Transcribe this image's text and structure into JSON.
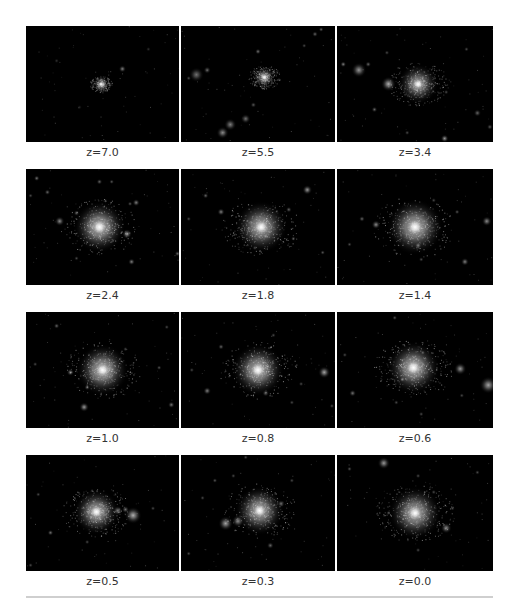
{
  "figure": {
    "rows": [
      {
        "panels": [
          {
            "caption": "z=7.0",
            "main": {
              "x": 0.49,
              "y": 0.5,
              "r": 0.05,
              "b": 0.55
            },
            "blobs": [
              [
                0.63,
                0.37,
                0.015,
                0.5
              ],
              [
                0.2,
                0.3,
                0.01,
                0.2
              ],
              [
                0.35,
                0.7,
                0.01,
                0.15
              ],
              [
                0.8,
                0.2,
                0.008,
                0.2
              ]
            ]
          },
          {
            "caption": "z=5.5",
            "main": {
              "x": 0.54,
              "y": 0.44,
              "r": 0.07,
              "b": 0.65
            },
            "blobs": [
              [
                0.1,
                0.42,
                0.03,
                0.45
              ],
              [
                0.17,
                0.38,
                0.015,
                0.4
              ],
              [
                0.05,
                0.45,
                0.01,
                0.3
              ],
              [
                0.32,
                0.85,
                0.025,
                0.5
              ],
              [
                0.27,
                0.92,
                0.025,
                0.55
              ],
              [
                0.42,
                0.8,
                0.02,
                0.45
              ],
              [
                0.47,
                0.68,
                0.012,
                0.35
              ],
              [
                0.5,
                0.22,
                0.012,
                0.45
              ],
              [
                0.87,
                0.07,
                0.012,
                0.4
              ],
              [
                0.91,
                0.03,
                0.01,
                0.4
              ],
              [
                0.8,
                0.17,
                0.008,
                0.3
              ]
            ]
          },
          {
            "caption": "z=3.4",
            "main": {
              "x": 0.52,
              "y": 0.5,
              "r": 0.13,
              "b": 0.75
            },
            "blobs": [
              [
                0.33,
                0.5,
                0.03,
                0.7
              ],
              [
                0.14,
                0.38,
                0.03,
                0.6
              ],
              [
                0.2,
                0.33,
                0.012,
                0.4
              ],
              [
                0.04,
                0.33,
                0.012,
                0.5
              ],
              [
                0.24,
                0.72,
                0.012,
                0.4
              ],
              [
                0.7,
                0.57,
                0.01,
                0.3
              ],
              [
                0.9,
                0.75,
                0.015,
                0.4
              ],
              [
                0.98,
                0.87,
                0.012,
                0.35
              ],
              [
                0.69,
                0.97,
                0.016,
                0.6
              ],
              [
                0.45,
                0.92,
                0.01,
                0.3
              ],
              [
                0.83,
                0.2,
                0.01,
                0.3
              ],
              [
                0.32,
                0.23,
                0.01,
                0.3
              ]
            ]
          }
        ]
      },
      {
        "panels": [
          {
            "caption": "z=2.4",
            "main": {
              "x": 0.48,
              "y": 0.5,
              "r": 0.17,
              "b": 0.9
            },
            "blobs": [
              [
                0.66,
                0.56,
                0.02,
                0.6
              ],
              [
                0.22,
                0.45,
                0.02,
                0.55
              ],
              [
                0.33,
                0.38,
                0.012,
                0.4
              ],
              [
                0.07,
                0.08,
                0.012,
                0.45
              ],
              [
                0.14,
                0.2,
                0.012,
                0.4
              ],
              [
                0.48,
                0.11,
                0.012,
                0.4
              ],
              [
                0.56,
                0.11,
                0.01,
                0.35
              ],
              [
                0.72,
                0.29,
                0.015,
                0.5
              ],
              [
                0.68,
                0.3,
                0.01,
                0.35
              ],
              [
                0.69,
                0.8,
                0.014,
                0.5
              ],
              [
                0.03,
                0.23,
                0.01,
                0.3
              ],
              [
                0.99,
                0.73,
                0.012,
                0.4
              ],
              [
                0.33,
                0.77,
                0.01,
                0.3
              ]
            ]
          },
          {
            "caption": "z=1.8",
            "main": {
              "x": 0.52,
              "y": 0.5,
              "r": 0.17,
              "b": 0.85
            },
            "blobs": [
              [
                0.82,
                0.18,
                0.02,
                0.6
              ],
              [
                0.26,
                0.37,
                0.015,
                0.5
              ],
              [
                0.16,
                0.23,
                0.012,
                0.4
              ],
              [
                0.7,
                0.35,
                0.012,
                0.4
              ],
              [
                0.73,
                0.6,
                0.01,
                0.35
              ],
              [
                0.55,
                0.58,
                0.012,
                0.4
              ],
              [
                0.92,
                0.72,
                0.01,
                0.35
              ],
              [
                0.48,
                0.68,
                0.01,
                0.3
              ],
              [
                0.05,
                0.43,
                0.01,
                0.3
              ]
            ]
          },
          {
            "caption": "z=1.4",
            "main": {
              "x": 0.5,
              "y": 0.5,
              "r": 0.18,
              "b": 0.9
            },
            "blobs": [
              [
                0.96,
                0.45,
                0.02,
                0.55
              ],
              [
                0.25,
                0.48,
                0.018,
                0.55
              ],
              [
                0.16,
                0.43,
                0.012,
                0.4
              ],
              [
                0.82,
                0.8,
                0.016,
                0.5
              ],
              [
                0.52,
                0.66,
                0.014,
                0.45
              ],
              [
                0.54,
                0.78,
                0.01,
                0.3
              ],
              [
                0.77,
                0.37,
                0.01,
                0.35
              ],
              [
                0.62,
                0.27,
                0.01,
                0.3
              ],
              [
                0.08,
                0.65,
                0.01,
                0.3
              ]
            ]
          }
        ]
      },
      {
        "panels": [
          {
            "caption": "z=1.0",
            "main": {
              "x": 0.5,
              "y": 0.5,
              "r": 0.17,
              "b": 0.9
            },
            "blobs": [
              [
                0.38,
                0.82,
                0.02,
                0.6
              ],
              [
                0.29,
                0.52,
                0.015,
                0.5
              ],
              [
                0.2,
                0.12,
                0.012,
                0.4
              ],
              [
                0.95,
                0.8,
                0.014,
                0.45
              ],
              [
                0.87,
                0.48,
                0.01,
                0.35
              ],
              [
                0.65,
                0.32,
                0.01,
                0.3
              ],
              [
                0.06,
                0.45,
                0.01,
                0.3
              ],
              [
                0.92,
                0.13,
                0.01,
                0.3
              ],
              [
                0.4,
                0.65,
                0.012,
                0.4
              ]
            ]
          },
          {
            "caption": "z=0.8",
            "main": {
              "x": 0.5,
              "y": 0.5,
              "r": 0.17,
              "b": 0.9
            },
            "blobs": [
              [
                0.93,
                0.52,
                0.025,
                0.65
              ],
              [
                0.17,
                0.68,
                0.016,
                0.5
              ],
              [
                0.26,
                0.3,
                0.012,
                0.4
              ],
              [
                0.55,
                0.7,
                0.014,
                0.4
              ],
              [
                0.78,
                0.62,
                0.01,
                0.3
              ],
              [
                0.72,
                0.78,
                0.01,
                0.3
              ],
              [
                0.98,
                0.81,
                0.01,
                0.3
              ],
              [
                0.07,
                0.5,
                0.01,
                0.3
              ],
              [
                0.6,
                0.2,
                0.01,
                0.3
              ]
            ]
          },
          {
            "caption": "z=0.6",
            "main": {
              "x": 0.49,
              "y": 0.48,
              "r": 0.17,
              "b": 0.9
            },
            "blobs": [
              [
                0.79,
                0.49,
                0.025,
                0.6
              ],
              [
                0.97,
                0.63,
                0.035,
                0.65
              ],
              [
                0.42,
                0.58,
                0.012,
                0.4
              ],
              [
                0.1,
                0.7,
                0.014,
                0.45
              ],
              [
                0.37,
                0.05,
                0.01,
                0.35
              ],
              [
                0.55,
                0.35,
                0.01,
                0.35
              ],
              [
                0.38,
                0.78,
                0.01,
                0.3
              ],
              [
                0.54,
                0.88,
                0.01,
                0.3
              ],
              [
                0.8,
                0.72,
                0.01,
                0.3
              ],
              [
                0.05,
                0.37,
                0.01,
                0.3
              ]
            ]
          }
        ]
      },
      {
        "panels": [
          {
            "caption": "z=0.5",
            "main": {
              "x": 0.46,
              "y": 0.49,
              "r": 0.15,
              "b": 0.85
            },
            "blobs": [
              [
                0.7,
                0.52,
                0.035,
                0.7
              ],
              [
                0.6,
                0.48,
                0.02,
                0.5
              ],
              [
                0.65,
                0.47,
                0.015,
                0.45
              ],
              [
                0.16,
                0.67,
                0.012,
                0.45
              ],
              [
                0.08,
                0.34,
                0.01,
                0.3
              ],
              [
                0.83,
                0.46,
                0.01,
                0.3
              ],
              [
                0.4,
                0.75,
                0.01,
                0.3
              ],
              [
                0.03,
                0.95,
                0.01,
                0.3
              ]
            ]
          },
          {
            "caption": "z=0.3",
            "main": {
              "x": 0.51,
              "y": 0.48,
              "r": 0.16,
              "b": 0.85
            },
            "blobs": [
              [
                0.29,
                0.59,
                0.03,
                0.65
              ],
              [
                0.37,
                0.57,
                0.025,
                0.55
              ],
              [
                0.65,
                0.42,
                0.015,
                0.45
              ],
              [
                0.58,
                0.78,
                0.014,
                0.4
              ],
              [
                0.22,
                0.22,
                0.01,
                0.35
              ],
              [
                0.34,
                0.18,
                0.01,
                0.3
              ],
              [
                0.72,
                0.22,
                0.01,
                0.3
              ],
              [
                0.14,
                0.37,
                0.01,
                0.3
              ],
              [
                0.05,
                0.85,
                0.01,
                0.3
              ],
              [
                0.42,
                0.02,
                0.01,
                0.3
              ]
            ]
          },
          {
            "caption": "z=0.0",
            "main": {
              "x": 0.5,
              "y": 0.5,
              "r": 0.17,
              "b": 0.85
            },
            "blobs": [
              [
                0.3,
                0.07,
                0.025,
                0.6
              ],
              [
                0.7,
                0.63,
                0.022,
                0.55
              ],
              [
                0.08,
                0.12,
                0.01,
                0.35
              ],
              [
                0.52,
                0.18,
                0.01,
                0.3
              ],
              [
                0.62,
                0.32,
                0.01,
                0.3
              ],
              [
                0.74,
                0.46,
                0.01,
                0.3
              ],
              [
                0.33,
                0.5,
                0.01,
                0.3
              ],
              [
                0.52,
                0.82,
                0.01,
                0.3
              ],
              [
                0.9,
                0.15,
                0.01,
                0.3
              ]
            ]
          }
        ]
      }
    ]
  }
}
